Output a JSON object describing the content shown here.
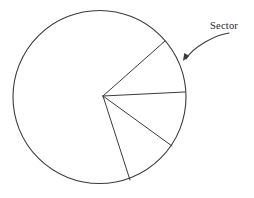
{
  "figure": {
    "background_color": "#ffffff",
    "stroke_color": "#3a3a40",
    "text_color": "#26262b"
  },
  "callout": {
    "label": "Sector",
    "label_x": 210,
    "label_y": 29,
    "arrow_tip_x": 183,
    "arrow_tip_y": 61,
    "arrow_start_x": 229,
    "arrow_start_y": 33
  },
  "chart_data": {
    "type": "pie",
    "title": "",
    "subtitle": "",
    "xlabel": "",
    "ylabel": "",
    "legend_position": "none",
    "grid": false,
    "center_x": 99.5,
    "center_y": 97,
    "radius": 86.5,
    "vertex_x": 103,
    "vertex_y": 96,
    "annotations": [
      {
        "text": "Sector",
        "points_to": "wedge between upper radius and horizontal radius"
      }
    ],
    "radii_endpoints": [
      {
        "name": "upper-right-radius",
        "x": 165,
        "y": 41
      },
      {
        "name": "right-horizontal-radius",
        "x": 185,
        "y": 92
      },
      {
        "name": "lower-right-radius",
        "x": 172,
        "y": 146
      },
      {
        "name": "bottom-radius",
        "x": 130,
        "y": 180
      }
    ],
    "categories": [
      "upper sector",
      "middle sector",
      "lower sector",
      "remaining major sector"
    ],
    "values": [
      41,
      37,
      37,
      245
    ],
    "value_unit": "degrees",
    "note": "Four radii drawn from a common vertex divide the circle; three narrow adjacent sectors on the right side and one large remaining region."
  }
}
